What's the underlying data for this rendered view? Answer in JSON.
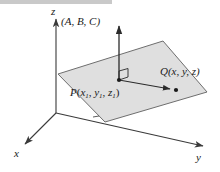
{
  "figure": {
    "background_color": "#ffffff",
    "plane_fill_color": "#dcdcdc",
    "line_color": "#3a3a3a",
    "label_color": "#1a1a1a"
  },
  "axes": {
    "z_label": "z",
    "x_label": "x",
    "y_label": "y",
    "origin": {
      "x": 56,
      "y": 113
    }
  },
  "labels": {
    "normal_vector": "(A, B, C)",
    "point_p": {
      "name": "P",
      "open": "(",
      "x": "x",
      "x_sub": "1",
      "sep1": ", ",
      "y": "y",
      "y_sub": "1",
      "sep2": ", ",
      "z": "z",
      "z_sub": "1",
      "close": ")"
    },
    "point_q": {
      "name": "Q",
      "text": "(x, y, z)"
    }
  },
  "geometry": {
    "plane_corners": "58,74 163,41 207,92 105,122",
    "normal_arrow": {
      "from_x": 119,
      "from_y": 80,
      "to_x": 119,
      "to_y": 24
    },
    "pq_arrow": {
      "from_x": 119,
      "from_y": 80,
      "to_x": 176,
      "to_y": 90
    },
    "right_angle_marker": {
      "x": 119,
      "y": 68,
      "size": 9
    }
  }
}
